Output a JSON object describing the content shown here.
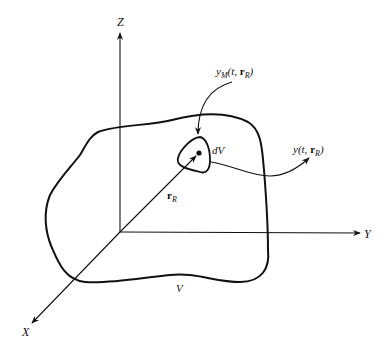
{
  "figure": {
    "type": "3d-volume-diagram",
    "background": "#ffffff",
    "stroke_color": "#111111"
  },
  "axes": {
    "z": {
      "label": "Z"
    },
    "y": {
      "label": "Y"
    },
    "x": {
      "label": "X"
    }
  },
  "labels": {
    "volume": "V",
    "element": "dV",
    "position_vector": {
      "base": "r",
      "subscript": "R"
    },
    "source_term": {
      "base": "y",
      "subscript": "M",
      "args_prefix": "(t, ",
      "vec": "r",
      "vec_subscript": "R",
      "args_suffix": ")"
    },
    "output_term": {
      "base": "y",
      "args_prefix": "(t, ",
      "vec": "r",
      "vec_subscript": "R",
      "args_suffix": ")"
    }
  }
}
